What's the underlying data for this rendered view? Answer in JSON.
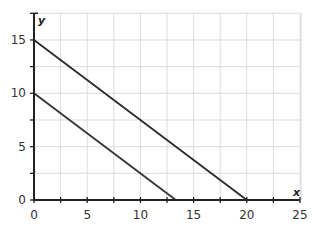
{
  "chart_data": {
    "type": "line",
    "title": "",
    "xlabel": "x",
    "ylabel": "y",
    "xlim": [
      0,
      25
    ],
    "ylim": [
      0,
      17.5
    ],
    "x_ticks": [
      0,
      5,
      10,
      15,
      20,
      25
    ],
    "y_ticks": [
      0,
      5,
      10,
      15
    ],
    "grid": true,
    "grid_step": 2.5,
    "legend": null,
    "series": [
      {
        "name": "line-upper",
        "points": [
          [
            0,
            15
          ],
          [
            20,
            0
          ]
        ],
        "color": "#2a2a2a"
      },
      {
        "name": "line-lower",
        "points": [
          [
            0,
            10
          ],
          [
            13.33,
            0
          ]
        ],
        "color": "#333333"
      }
    ]
  },
  "labels": {
    "x_axis": "x",
    "y_axis": "y",
    "x_ticks": [
      "0",
      "5",
      "10",
      "15",
      "20",
      "25"
    ],
    "y_ticks": [
      "0",
      "5",
      "10",
      "15"
    ]
  }
}
